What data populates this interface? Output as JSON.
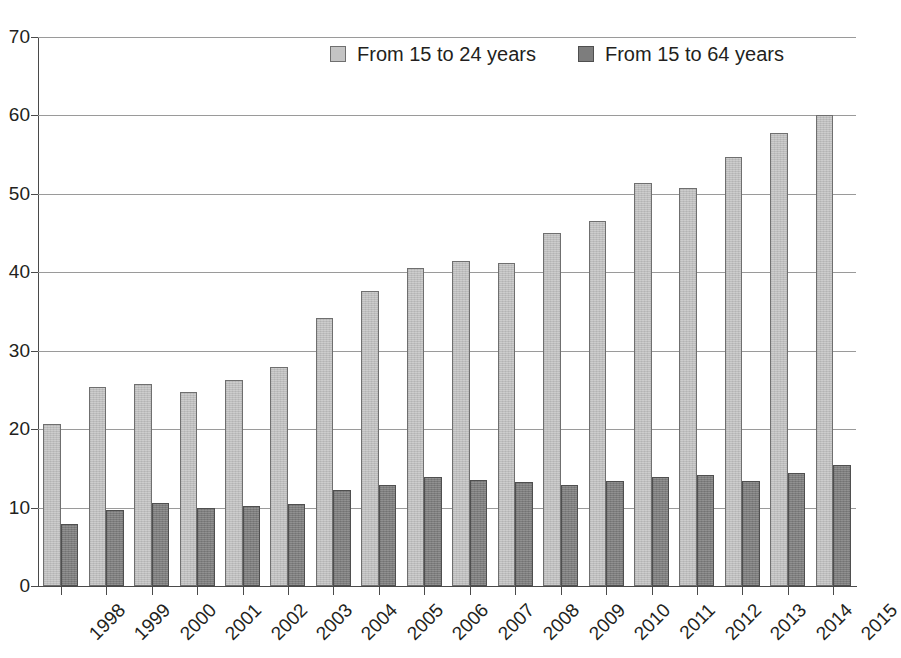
{
  "chart_data": {
    "type": "bar",
    "title": "",
    "subtitle": "",
    "xlabel": "",
    "ylabel": "",
    "ylim": [
      0,
      70
    ],
    "y_ticks": [
      0,
      10,
      20,
      30,
      40,
      50,
      60,
      70
    ],
    "grid": true,
    "legend_position": "top-center",
    "orientation": "vertical",
    "categories": [
      "1998",
      "1999",
      "2000",
      "2001",
      "2002",
      "2003",
      "2004",
      "2005",
      "2006",
      "2007",
      "2008",
      "2009",
      "2010",
      "2011",
      "2012",
      "2013",
      "2014",
      "2015"
    ],
    "series": [
      {
        "name": "From 15 to 24 years",
        "color": "#c4c4c4",
        "values": [
          20.6,
          25.4,
          25.8,
          24.8,
          26.3,
          27.9,
          34.2,
          37.6,
          40.6,
          41.4,
          41.2,
          45.0,
          46.6,
          51.4,
          50.7,
          54.7,
          57.7,
          60.1
        ]
      },
      {
        "name": "From 15 to 64 years",
        "color": "#7d7d7d",
        "values": [
          7.9,
          9.7,
          10.6,
          9.9,
          10.2,
          10.5,
          12.2,
          12.9,
          13.9,
          13.5,
          13.2,
          12.9,
          13.4,
          13.9,
          14.2,
          13.4,
          14.4,
          15.4
        ]
      }
    ]
  },
  "legend": {
    "items": [
      {
        "label": "From 15 to 24 years",
        "swatch": "light-gray-swatch"
      },
      {
        "label": "From 15 to 64 years",
        "swatch": "dark-gray-swatch"
      }
    ]
  },
  "artifact": {
    "top_strip_text": ""
  }
}
